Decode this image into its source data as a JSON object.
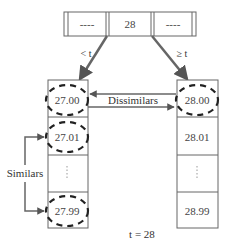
{
  "diagram": {
    "root_node": {
      "cells": [
        "----",
        "28",
        "----"
      ]
    },
    "edges": {
      "left_label": "< t",
      "right_label": "≥ t"
    },
    "left_bucket": {
      "cells": [
        "27.00",
        "27.01",
        "⋮",
        "27.99"
      ],
      "highlighted": [
        0,
        1,
        3
      ]
    },
    "right_bucket": {
      "cells": [
        "28.00",
        "28.01",
        "⋮",
        "28.99"
      ],
      "highlighted": [
        0
      ]
    },
    "annotations": {
      "dissimilars": "Dissimilars",
      "similars": "Similars",
      "threshold": "t = 28"
    },
    "colors": {
      "line": "#555555",
      "arrow": "#666666",
      "dash": "#222222",
      "text": "#333333"
    }
  }
}
